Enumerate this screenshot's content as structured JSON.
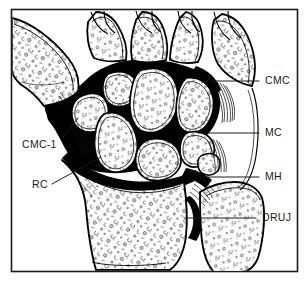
{
  "figure": {
    "kind": "anatomical-line-drawing",
    "colors": {
      "background": "#ffffff",
      "ink": "#000000",
      "joint_space": "#000000",
      "frame": "#1a1a1a",
      "label_text": "#1a1a1a",
      "leader_line": "#1a1a1a"
    },
    "frame": {
      "x": 11,
      "y": 9,
      "width": 287,
      "height": 263,
      "stroke_width": 1.6
    }
  },
  "labels": [
    {
      "id": "cmc",
      "text": "CMC",
      "x": 265,
      "y": 84,
      "anchor": "start",
      "leader": {
        "x1": 210,
        "y1": 81,
        "x2": 259,
        "y2": 81
      }
    },
    {
      "id": "mc",
      "text": "MC",
      "x": 265,
      "y": 136,
      "anchor": "start",
      "leader": {
        "x1": 198,
        "y1": 133,
        "x2": 259,
        "y2": 133
      }
    },
    {
      "id": "mh",
      "text": "MH",
      "x": 265,
      "y": 180,
      "anchor": "start",
      "leader": {
        "x1": 200,
        "y1": 177,
        "x2": 259,
        "y2": 177
      }
    },
    {
      "id": "druj",
      "text": "DRUJ",
      "x": 262,
      "y": 221,
      "anchor": "start",
      "leader": {
        "x1": 184,
        "y1": 218,
        "x2": 256,
        "y2": 218
      }
    },
    {
      "id": "cmc-1",
      "text": "CMC-1",
      "x": 22,
      "y": 148,
      "anchor": "start",
      "leader": {
        "x1": 62,
        "y1": 139,
        "x2": 78,
        "y2": 118
      }
    },
    {
      "id": "rc",
      "text": "RC",
      "x": 32,
      "y": 188,
      "anchor": "start",
      "leader": {
        "x1": 52,
        "y1": 184,
        "x2": 101,
        "y2": 157
      }
    }
  ],
  "legend_meaning": [
    {
      "abbr": "CMC",
      "region": "carpometacarpal joints"
    },
    {
      "abbr": "MC",
      "region": "midcarpal joint"
    },
    {
      "abbr": "MH",
      "region": "mid-hamate / ulnocarpal region"
    },
    {
      "abbr": "DRUJ",
      "region": "distal radioulnar joint"
    },
    {
      "abbr": "CMC-1",
      "region": "first carpometacarpal joint"
    },
    {
      "abbr": "RC",
      "region": "radiocarpal joint"
    }
  ],
  "bones": [
    {
      "name": "first-metacarpal",
      "side": "radial"
    },
    {
      "name": "metacarpal-base-2",
      "side": "radial"
    },
    {
      "name": "metacarpal-base-3",
      "side": "central"
    },
    {
      "name": "metacarpal-base-4",
      "side": "ulnar"
    },
    {
      "name": "metacarpal-base-5",
      "side": "ulnar"
    },
    {
      "name": "trapezium",
      "side": "radial"
    },
    {
      "name": "trapezoid",
      "side": "radial"
    },
    {
      "name": "capitate",
      "side": "central"
    },
    {
      "name": "hamate",
      "side": "ulnar"
    },
    {
      "name": "scaphoid",
      "side": "radial"
    },
    {
      "name": "lunate",
      "side": "central"
    },
    {
      "name": "triquetrum",
      "side": "ulnar"
    },
    {
      "name": "pisiform",
      "side": "ulnar"
    },
    {
      "name": "radius",
      "side": "radial"
    },
    {
      "name": "ulna",
      "side": "ulnar"
    }
  ]
}
